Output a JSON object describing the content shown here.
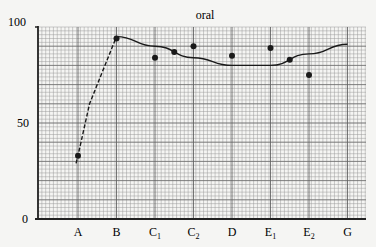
{
  "chart_data": {
    "type": "line",
    "title": "oral",
    "xlabel": "",
    "ylabel": "",
    "ylim": [
      0,
      100
    ],
    "yticks": [
      0,
      50,
      100
    ],
    "grid": true,
    "categories": [
      "A",
      "B",
      "C1",
      "C2",
      "D",
      "E1",
      "E2",
      "G"
    ],
    "category_labels": [
      {
        "main": "A",
        "sub": ""
      },
      {
        "main": "B",
        "sub": ""
      },
      {
        "main": "C",
        "sub": "1"
      },
      {
        "main": "C",
        "sub": "2"
      },
      {
        "main": "D",
        "sub": ""
      },
      {
        "main": "E",
        "sub": "1"
      },
      {
        "main": "E",
        "sub": "2"
      },
      {
        "main": "G",
        "sub": ""
      }
    ],
    "series": [
      {
        "name": "observed points",
        "style": "scatter",
        "points": [
          {
            "x": 1.0,
            "y": 33
          },
          {
            "x": 2.0,
            "y": 94
          },
          {
            "x": 3.0,
            "y": 84
          },
          {
            "x": 3.5,
            "y": 87
          },
          {
            "x": 4.0,
            "y": 90
          },
          {
            "x": 5.0,
            "y": 85
          },
          {
            "x": 6.0,
            "y": 89
          },
          {
            "x": 6.5,
            "y": 83
          },
          {
            "x": 7.0,
            "y": 75
          }
        ]
      },
      {
        "name": "dashed rise",
        "style": "dashed-line",
        "points": [
          {
            "x": 0.95,
            "y": 29
          },
          {
            "x": 1.0,
            "y": 33
          },
          {
            "x": 1.3,
            "y": 60
          },
          {
            "x": 1.6,
            "y": 75
          },
          {
            "x": 2.0,
            "y": 95
          }
        ]
      },
      {
        "name": "trend curve",
        "style": "solid-line",
        "points": [
          {
            "x": 2.0,
            "y": 95
          },
          {
            "x": 3.0,
            "y": 90
          },
          {
            "x": 4.0,
            "y": 84
          },
          {
            "x": 5.0,
            "y": 80
          },
          {
            "x": 6.0,
            "y": 80
          },
          {
            "x": 7.0,
            "y": 86
          },
          {
            "x": 8.0,
            "y": 91
          }
        ]
      }
    ]
  },
  "layout": {
    "plot_left": 38,
    "plot_right": 366,
    "plot_top": 27,
    "plot_bottom": 219,
    "x_first_category_px": 78,
    "x_category_step_px": 38.5
  }
}
